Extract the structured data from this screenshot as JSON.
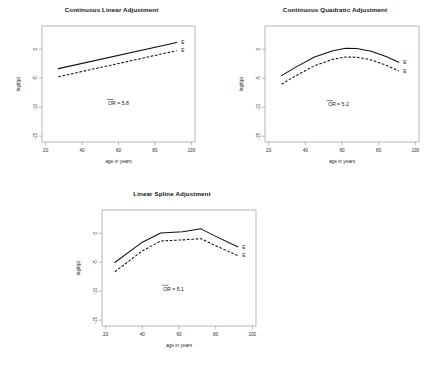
{
  "figure": {
    "background": "#ffffff",
    "ink": "#111111",
    "axis_color": "#9a9a9a"
  },
  "chart_data": [
    {
      "type": "line",
      "title": "Continuous Linear Adjustment",
      "xlabel": "age in years",
      "ylabel": "logit(p)",
      "xlim": [
        18,
        102
      ],
      "ylim": [
        -16,
        4
      ],
      "xticks": [
        20,
        40,
        60,
        80,
        100
      ],
      "yticks": [
        0,
        -5,
        -10,
        -15
      ],
      "grid": false,
      "legend": "inline-right-end",
      "annotation": {
        "text": "OR = 5.8",
        "overbar": true,
        "x": 60,
        "y": -9.6
      },
      "series": [
        {
          "name": "E",
          "style": "solid",
          "label": "E",
          "x": [
            27,
            92
          ],
          "values": [
            -3.35,
            1.15
          ]
        },
        {
          "name": "E-unexposed",
          "style": "dashed",
          "label": "E",
          "x": [
            27,
            92
          ],
          "values": [
            -4.75,
            -0.25
          ]
        }
      ]
    },
    {
      "type": "line",
      "title": "Continuous Quadratic Adjustment",
      "xlabel": "age in years",
      "ylabel": "logit(p)",
      "xlim": [
        18,
        102
      ],
      "ylim": [
        -16,
        4
      ],
      "xticks": [
        20,
        40,
        60,
        80,
        100
      ],
      "yticks": [
        0,
        -5,
        -10,
        -15
      ],
      "grid": false,
      "legend": "inline-right-end",
      "annotation": {
        "text": "OR = 5.2",
        "overbar": true,
        "x": 58,
        "y": -9.8
      },
      "series": [
        {
          "name": "E",
          "style": "solid",
          "label": "E",
          "x": [
            27,
            35,
            45,
            55,
            62,
            68,
            76,
            84,
            91
          ],
          "values": [
            -4.55,
            -3.05,
            -1.35,
            -0.25,
            0.15,
            0.12,
            -0.35,
            -1.25,
            -2.25
          ]
        },
        {
          "name": "E-unexposed",
          "style": "dashed",
          "label": "E",
          "x": [
            27,
            35,
            45,
            55,
            62,
            68,
            76,
            84,
            91
          ],
          "values": [
            -6.05,
            -4.55,
            -2.85,
            -1.75,
            -1.35,
            -1.38,
            -1.85,
            -2.75,
            -3.75
          ]
        }
      ]
    },
    {
      "type": "line",
      "title": "Linear Spline Adjustment",
      "xlabel": "age in years",
      "ylabel": "logit(p)",
      "xlim": [
        18,
        102
      ],
      "ylim": [
        -16,
        4
      ],
      "xticks": [
        20,
        40,
        60,
        80,
        100
      ],
      "yticks": [
        0,
        -5,
        -10,
        -15
      ],
      "grid": false,
      "legend": "inline-right-end",
      "annotation": {
        "text": "OR = 5.1",
        "overbar": true,
        "x": 57,
        "y": -9.9
      },
      "series": [
        {
          "name": "E",
          "style": "solid",
          "label": "E",
          "x": [
            25,
            40,
            50,
            62,
            72,
            80,
            92
          ],
          "values": [
            -5.05,
            -1.55,
            0.05,
            0.25,
            0.75,
            -0.55,
            -2.35
          ]
        },
        {
          "name": "E-unexposed",
          "style": "dashed",
          "label": "E",
          "x": [
            25,
            40,
            50,
            62,
            72,
            80,
            92
          ],
          "values": [
            -6.65,
            -3.05,
            -1.35,
            -1.15,
            -0.95,
            -2.15,
            -3.85
          ]
        }
      ]
    }
  ]
}
